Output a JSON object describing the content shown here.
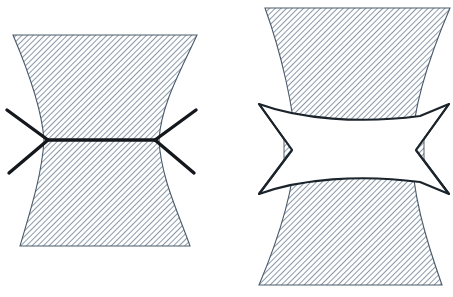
{
  "figure": {
    "title": "Necking and shear-band deformation diagrams",
    "background_color": "#ffffff",
    "width": 453,
    "height": 297,
    "panel_count": 2
  },
  "style": {
    "hatch_color": "#6d8093",
    "hatch_spacing_px": 4,
    "hatch_stroke_width": 1.1,
    "hatch_angle_deg": 45,
    "outline_color": "#2f3a45",
    "outline_width": 1.2,
    "line_color": "#14181c",
    "slip_line_width": 3.4,
    "white_fill": "#ffffff"
  },
  "panels": [
    {
      "id": "left-panel",
      "name": "necked-specimen-with-slip-lines",
      "label": "",
      "body": {
        "name": "hatched-hourglass-body",
        "fill": "hatched",
        "top_left_x": 13,
        "top_right_x": 197,
        "top_y": 35,
        "bottom_left_x": 20,
        "bottom_right_x": 190,
        "bottom_y": 246,
        "waist_left_x": 44,
        "waist_right_x": 159,
        "waist_y": 140
      },
      "slip_lines": {
        "name": "slip-line-field",
        "count": 5,
        "horizontal_segment": {
          "x1": 47,
          "y1": 140,
          "x2": 156,
          "y2": 140
        },
        "branches": [
          {
            "x1": 47,
            "y1": 140,
            "x2": 7,
            "y2": 110
          },
          {
            "x1": 47,
            "y1": 140,
            "x2": 9,
            "y2": 172
          },
          {
            "x1": 156,
            "y1": 140,
            "x2": 196,
            "y2": 110
          },
          {
            "x1": 156,
            "y1": 140,
            "x2": 194,
            "y2": 172
          }
        ]
      }
    },
    {
      "id": "right-panel",
      "name": "necked-specimen-with-deformation-zone",
      "label": "",
      "body": {
        "name": "hatched-hourglass-body",
        "fill": "hatched",
        "top_left_x": 265,
        "top_right_x": 450,
        "top_y": 8,
        "bottom_left_x": 259,
        "bottom_right_x": 442,
        "bottom_y": 285,
        "waist_left_x": 296,
        "waist_right_x": 412,
        "waist_y": 147
      },
      "overlay": {
        "name": "white-deformation-zone",
        "fill": "#ffffff",
        "outline": "#1b232b",
        "left_tip_x": 290,
        "right_tip_x": 418,
        "mid_y": 150,
        "top_y": 105,
        "bottom_y": 193,
        "outer_left_x": 259,
        "outer_right_x": 449,
        "notch_inner_left_x": 293,
        "notch_inner_right_x": 415
      },
      "notch_triangles": [
        {
          "name": "left-notch-hatched-sliver",
          "x": 283,
          "y": 137,
          "w": 14,
          "h": 26
        },
        {
          "name": "right-notch-hatched-sliver",
          "x": 411,
          "y": 137,
          "w": 14,
          "h": 26
        }
      ]
    }
  ]
}
